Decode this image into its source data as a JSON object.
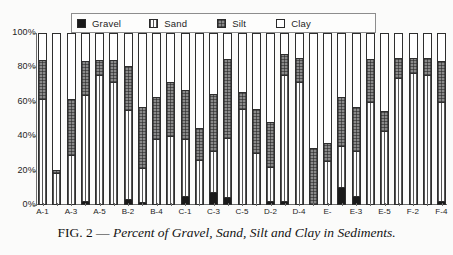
{
  "figure": {
    "caption_prefix": "FIG. 2 —",
    "caption_text": "Percent of Gravel, Sand, Silt and Clay in Sediments."
  },
  "legend": {
    "position": "top-center",
    "items": [
      {
        "label": "Gravel",
        "swatch": "gravel-swatch",
        "color": "#1a1a1a"
      },
      {
        "label": "Sand",
        "swatch": "sand-swatch",
        "color": "#fdfdfd"
      },
      {
        "label": "Silt",
        "swatch": "silt-swatch",
        "color": "#8a8a8a"
      },
      {
        "label": "Clay",
        "swatch": "clay-swatch",
        "color": "#ffffff"
      }
    ]
  },
  "chart_data": {
    "type": "bar",
    "stacked": true,
    "title": "Percent of Gravel, Sand, Silt and Clay in Sediments",
    "xlabel": "",
    "ylabel": "",
    "ylim": [
      0,
      100
    ],
    "grid": false,
    "ytick_labels": [
      "100%",
      "80%",
      "60%",
      "40%",
      "20%",
      "0%"
    ],
    "ytick_values": [
      100,
      80,
      60,
      40,
      20,
      0
    ],
    "legend_entries": [
      "Gravel",
      "Sand",
      "Silt",
      "Clay"
    ],
    "categories": [
      "A-1",
      "A-2",
      "A-3",
      "A-4",
      "A-5",
      "B-1",
      "B-2",
      "B-3",
      "B-4",
      "B-5",
      "C-1",
      "C-2",
      "C-3",
      "C-4",
      "C-5",
      "D-1",
      "D-2",
      "D-3",
      "D-4",
      "D-5",
      "E-",
      "E-2",
      "E-3",
      "E-4",
      "E-5",
      "F-1",
      "F-2",
      "F-3",
      "F-4"
    ],
    "visible_tick_labels": [
      "A-1",
      "A-3",
      "A-5",
      "B-2",
      "B-4",
      "C-1",
      "C-3",
      "C-5",
      "D-2",
      "D-4",
      "E-",
      "E-3",
      "E-5",
      "F-2",
      "F-4"
    ],
    "series": [
      {
        "name": "Gravel",
        "color": "#1a1a1a",
        "values": [
          0,
          0,
          0,
          2,
          0,
          0,
          3,
          1,
          0,
          0,
          5,
          0,
          7,
          4,
          0,
          0,
          2,
          2,
          0,
          0,
          0,
          10,
          5,
          0,
          0,
          0,
          0,
          0,
          2
        ]
      },
      {
        "name": "Sand",
        "color": "#fdfdfd",
        "values": [
          62,
          18,
          29,
          62,
          76,
          72,
          52,
          20,
          38,
          40,
          33,
          26,
          24,
          35,
          56,
          30,
          20,
          74,
          72,
          0,
          25,
          24,
          26,
          60,
          43,
          74,
          77,
          76,
          58
        ]
      },
      {
        "name": "Silt",
        "color": "#8a8a8a",
        "values": [
          23,
          2,
          33,
          20,
          9,
          13,
          26,
          36,
          25,
          32,
          29,
          19,
          34,
          46,
          10,
          26,
          26,
          12,
          14,
          33,
          11,
          29,
          26,
          25,
          12,
          12,
          9,
          10,
          24
        ]
      },
      {
        "name": "Clay",
        "color": "#ffffff",
        "values": [
          15,
          80,
          38,
          16,
          15,
          15,
          19,
          43,
          37,
          28,
          33,
          55,
          35,
          15,
          34,
          44,
          52,
          12,
          14,
          67,
          64,
          37,
          43,
          15,
          45,
          14,
          14,
          14,
          16
        ]
      }
    ]
  }
}
